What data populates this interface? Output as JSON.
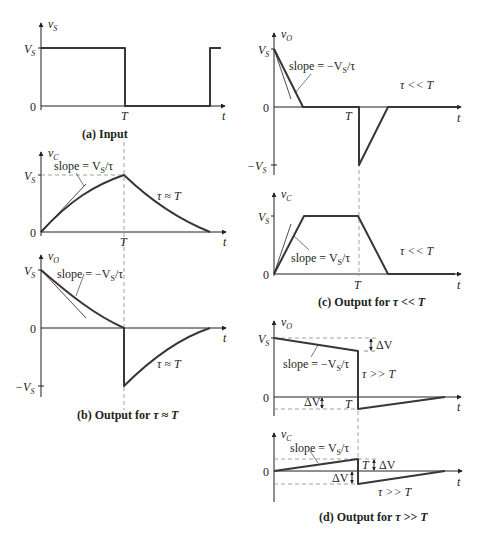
{
  "figure": {
    "colors": {
      "ink": "#231f20",
      "waveform": "#3a3536",
      "dashed": "#8a8a8a",
      "background": "#ffffff"
    }
  },
  "panels": {
    "a": {
      "caption": "(a)  Input",
      "y_axis_label": "v",
      "y_axis_sub": "S",
      "ticks": {
        "vs": "V",
        "vs_sub": "S",
        "zero": "0",
        "T": "T",
        "t": "t"
      }
    },
    "b_top": {
      "y_axis_label": "v",
      "y_axis_sub": "C",
      "ticks": {
        "vs": "V",
        "vs_sub": "S",
        "zero": "0",
        "T": "T",
        "t": "t"
      },
      "slope_label": "slope = V",
      "slope_sub": "S",
      "slope_tail": "/τ",
      "regime": "τ ≈ T"
    },
    "b_bottom": {
      "y_axis_label": "v",
      "y_axis_sub": "O",
      "ticks": {
        "vs": "V",
        "vs_sub": "S",
        "zero": "0",
        "neg_vs": "−V",
        "neg_vs_sub": "S",
        "t": "t"
      },
      "slope_label": "slope = −V",
      "slope_sub": "S",
      "slope_tail": "/τ",
      "regime": "τ ≈ T",
      "caption": "(b)  Output for ",
      "caption_tail": "τ ≈ T"
    },
    "c_top": {
      "y_axis_label": "v",
      "y_axis_sub": "O",
      "ticks": {
        "vs": "V",
        "vs_sub": "S",
        "zero": "0",
        "neg_vs": "−V",
        "neg_vs_sub": "S",
        "T": "T",
        "t": "t"
      },
      "slope_label": "slope = −V",
      "slope_sub": "S",
      "slope_tail": "/τ",
      "regime": "τ << T"
    },
    "c_bottom": {
      "y_axis_label": "v",
      "y_axis_sub": "C",
      "ticks": {
        "vs": "V",
        "vs_sub": "S",
        "zero": "0",
        "T": "T",
        "t": "t"
      },
      "slope_label": "slope = V",
      "slope_sub": "S",
      "slope_tail": "/τ",
      "regime": "τ << T",
      "caption": "(c)  Output for ",
      "caption_tail": "τ << T"
    },
    "d_top": {
      "y_axis_label": "v",
      "y_axis_sub": "O",
      "ticks": {
        "vs": "V",
        "vs_sub": "S",
        "zero": "0",
        "T": "T",
        "t": "t"
      },
      "slope_label": "slope = −V",
      "slope_sub": "S",
      "slope_tail": "/τ",
      "regime": "τ >> T",
      "delta_upper": "ΔV",
      "delta_lower": "ΔV"
    },
    "d_bottom": {
      "y_axis_label": "v",
      "y_axis_sub": "C",
      "ticks": {
        "zero": "0",
        "T": "T",
        "t": "t"
      },
      "slope_label": "slope = V",
      "slope_sub": "S",
      "slope_tail": "/τ",
      "regime": "τ >> T",
      "delta_upper": "ΔV",
      "delta_lower": "ΔV",
      "caption": "(d)  Output for ",
      "caption_tail": "τ >> T"
    }
  }
}
